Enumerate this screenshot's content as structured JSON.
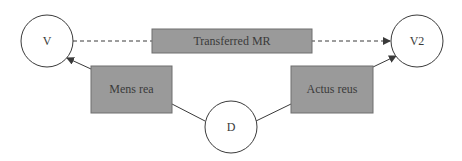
{
  "diagram": {
    "nodes": {
      "v": {
        "label": "V"
      },
      "v2": {
        "label": "V2"
      },
      "d": {
        "label": "D"
      },
      "transferred_mr": {
        "label": "Transferred MR"
      },
      "mens_rea": {
        "label": "Mens rea"
      },
      "actus_reus": {
        "label": "Actus reus"
      }
    },
    "edges": [
      {
        "from": "v",
        "to": "v2",
        "style": "dashed",
        "arrow": "end",
        "via": "Transferred MR"
      },
      {
        "from": "d",
        "to": "v",
        "style": "solid",
        "arrow": "end",
        "via": "Mens rea"
      },
      {
        "from": "d",
        "to": "v2",
        "style": "solid",
        "arrow": "end",
        "via": "Actus reus"
      }
    ],
    "colors": {
      "box_fill": "#9a9a9a",
      "box_stroke": "#6e6e6e",
      "line": "#3a3a3a",
      "circle_fill": "#ffffff"
    }
  }
}
